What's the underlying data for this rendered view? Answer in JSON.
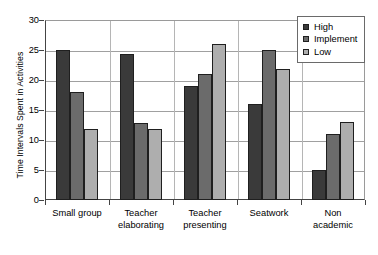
{
  "chart_data": {
    "type": "bar",
    "title": "",
    "xlabel": "",
    "ylabel": "Time Intervals Spent in Activities",
    "ylim": [
      0,
      30
    ],
    "ytick_step": 5,
    "yticks": [
      0,
      5,
      10,
      15,
      20,
      25,
      30
    ],
    "grid": true,
    "legend_position": "top-right",
    "categories": [
      "Small group",
      "Teacher elaborating",
      "Teacher presenting",
      "Seatwork",
      "Non academic"
    ],
    "category_lines": [
      [
        "Small group"
      ],
      [
        "Teacher",
        "elaborating"
      ],
      [
        "Teacher",
        "presenting"
      ],
      [
        "Seatwork"
      ],
      [
        "Non",
        "academic"
      ]
    ],
    "series": [
      {
        "name": "High",
        "color": "#3a3a3a",
        "values": [
          25,
          24.3,
          19,
          16,
          5
        ]
      },
      {
        "name": "Implement",
        "color": "#6b6b6b",
        "values": [
          18,
          12.8,
          21,
          25,
          11
        ]
      },
      {
        "name": "Low",
        "color": "#aeaeae",
        "values": [
          11.8,
          11.8,
          26,
          21.8,
          13
        ]
      }
    ]
  },
  "legend": {
    "entries": [
      {
        "label": "High",
        "color": "#3a3a3a"
      },
      {
        "label": "Implement",
        "color": "#6b6b6b"
      },
      {
        "label": "Low",
        "color": "#aeaeae"
      }
    ]
  },
  "axis": {
    "y_title": "Time Intervals Spent in Activities",
    "y_tick_labels": [
      "0",
      "5",
      "10",
      "15",
      "20",
      "25",
      "30"
    ]
  }
}
